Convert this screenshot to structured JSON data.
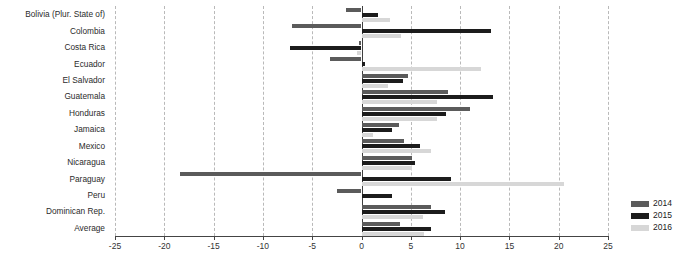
{
  "chart_data": {
    "type": "bar",
    "orientation": "horizontal",
    "title": "",
    "xlabel": "",
    "ylabel": "",
    "xlim": [
      -25,
      25
    ],
    "xticks": [
      -25,
      -20,
      -15,
      -10,
      -5,
      0,
      5,
      10,
      15,
      20,
      25
    ],
    "xticklabels": [
      "-25",
      "-20",
      "-15",
      "-10",
      "-5",
      "0",
      "5",
      "10",
      "15",
      "20",
      "25"
    ],
    "grid": true,
    "grid_axis": "x",
    "legend_position": "right",
    "categories": [
      "Bolivia (Plur. State of)",
      "Colombia",
      "Costa Rica",
      "Ecuador",
      "El Salvador",
      "Guatemala",
      "Honduras",
      "Jamaica",
      "Mexico",
      "Nicaragua",
      "Paraguay",
      "Peru",
      "Dominican Rep.",
      "Average"
    ],
    "series": [
      {
        "name": "2014",
        "color": "#5b5b5b",
        "values": [
          -1.6,
          -7.0,
          -0.3,
          -3.2,
          4.7,
          8.8,
          11.0,
          3.8,
          4.3,
          5.1,
          -18.4,
          -2.5,
          7.0,
          3.9
        ]
      },
      {
        "name": "2015",
        "color": "#1c1c1c",
        "values": [
          1.7,
          13.1,
          -7.3,
          0.4,
          4.2,
          13.3,
          8.6,
          3.1,
          5.9,
          5.4,
          9.1,
          3.1,
          8.5,
          7.0
        ]
      },
      {
        "name": "2016",
        "color": "#d7d7d7",
        "values": [
          2.9,
          4.0,
          -0.5,
          12.1,
          2.7,
          7.7,
          7.7,
          1.2,
          7.0,
          5.1,
          20.5,
          0.0,
          6.2,
          6.3
        ]
      }
    ]
  },
  "legend": {
    "items": [
      {
        "label": "2014"
      },
      {
        "label": "2015"
      },
      {
        "label": "2016"
      }
    ]
  },
  "footnote": {
    "text": ""
  }
}
